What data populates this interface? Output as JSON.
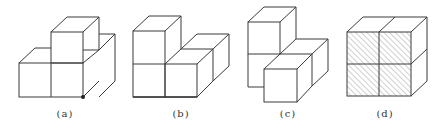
{
  "figures": [
    {
      "id": "a",
      "label": "(a)",
      "description": "three front cubes in L arrangement with one cube on top, marked corner dot",
      "label_x": 65
    },
    {
      "id": "b",
      "label": "(b)",
      "description": "two-cube column on left, one front cube right with one cube behind",
      "label_x": 181
    },
    {
      "id": "c",
      "label": "(c)",
      "description": "staggered cube arrangement, front cube offset lower-right",
      "label_x": 288
    },
    {
      "id": "d",
      "label": "(d)",
      "description": "2x2 block of cubes with hatched front faces",
      "label_x": 385
    }
  ],
  "colors": {
    "stroke": "#3a3a3a",
    "hatch": "#8a8a8a",
    "background": "#ffffff"
  }
}
